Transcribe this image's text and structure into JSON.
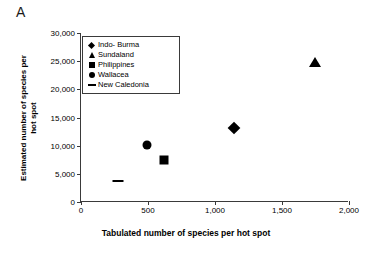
{
  "panel": {
    "label": "A"
  },
  "chart_data": {
    "type": "scatter",
    "title": "",
    "xlabel": "Tabulated number of species per hot spot",
    "ylabel_line1": "Estimated number of species per",
    "ylabel_line2": "hot spot",
    "xlim": [
      0,
      2000
    ],
    "ylim": [
      0,
      30000
    ],
    "xticks": [
      0,
      500,
      1000,
      1500,
      2000
    ],
    "xtick_labels": [
      "0",
      "500",
      "1,000",
      "1,500",
      "2,000"
    ],
    "yticks": [
      0,
      5000,
      10000,
      15000,
      20000,
      25000,
      30000
    ],
    "ytick_labels": [
      "0",
      "5,000",
      "10,000",
      "15,000",
      "20,000",
      "25,000",
      "30,000"
    ],
    "grid": false,
    "legend_position": "upper-left-inside",
    "series": [
      {
        "name": "Indo- Burma",
        "marker": "diamond",
        "x": 1140,
        "y": 13200
      },
      {
        "name": "Sundaland",
        "marker": "triangle",
        "x": 1745,
        "y": 24900
      },
      {
        "name": "Philippines",
        "marker": "square",
        "x": 620,
        "y": 7500
      },
      {
        "name": "Wallacea",
        "marker": "circle",
        "x": 495,
        "y": 10200
      },
      {
        "name": "New Caledonia",
        "marker": "dash",
        "x": 275,
        "y": 3700
      }
    ]
  }
}
